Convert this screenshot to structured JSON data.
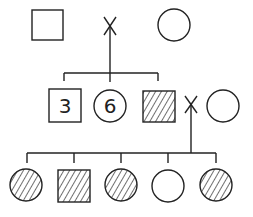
{
  "diagram": {
    "type": "pedigree",
    "generations": [
      {
        "level": 1,
        "individuals": [
          {
            "id": "g1-male",
            "sex": "male",
            "affected": false,
            "label": ""
          },
          {
            "id": "g1-female",
            "sex": "female",
            "affected": false,
            "label": ""
          }
        ],
        "mating_symbol": "X"
      },
      {
        "level": 2,
        "individuals": [
          {
            "id": "g2-males-group",
            "sex": "male",
            "affected": false,
            "label": "3"
          },
          {
            "id": "g2-females-group",
            "sex": "female",
            "affected": false,
            "label": "6"
          },
          {
            "id": "g2-affected-male",
            "sex": "male",
            "affected": true,
            "label": ""
          },
          {
            "id": "g2-spouse",
            "sex": "female",
            "affected": false,
            "label": ""
          }
        ],
        "mating_symbol": "X"
      },
      {
        "level": 3,
        "individuals": [
          {
            "id": "g3-1",
            "sex": "female",
            "affected": true,
            "label": ""
          },
          {
            "id": "g3-2",
            "sex": "male",
            "affected": true,
            "label": ""
          },
          {
            "id": "g3-3",
            "sex": "female",
            "affected": true,
            "label": ""
          },
          {
            "id": "g3-4",
            "sex": "female",
            "affected": false,
            "label": ""
          },
          {
            "id": "g3-5",
            "sex": "female",
            "affected": true,
            "label": ""
          }
        ]
      }
    ],
    "colors": {
      "stroke": "#222222",
      "background": "#ffffff"
    }
  }
}
